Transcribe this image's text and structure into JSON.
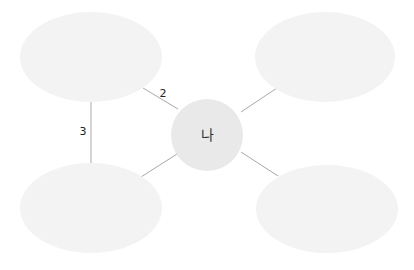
{
  "diagram": {
    "type": "mind-map",
    "center": {
      "label": "나",
      "cx": 207,
      "cy": 135,
      "r": 36,
      "color": "#e9e9e9"
    },
    "nodes": [
      {
        "id": "top-left",
        "label": "",
        "cx": 91,
        "cy": 57,
        "rx": 71,
        "ry": 45
      },
      {
        "id": "top-right",
        "label": "",
        "cx": 325,
        "cy": 57,
        "rx": 70,
        "ry": 45
      },
      {
        "id": "bottom-left",
        "label": "",
        "cx": 91,
        "cy": 208,
        "rx": 71,
        "ry": 45
      },
      {
        "id": "bottom-right",
        "label": "",
        "cx": 327,
        "cy": 209,
        "rx": 71,
        "ry": 44
      }
    ],
    "edges": [
      {
        "from": "top-left",
        "to": "center",
        "label": "2"
      },
      {
        "from": "top-left",
        "to": "bottom-left",
        "label": "3"
      },
      {
        "from": "top-right",
        "to": "center",
        "label": ""
      },
      {
        "from": "bottom-left",
        "to": "center",
        "label": ""
      },
      {
        "from": "bottom-right",
        "to": "center",
        "label": ""
      }
    ],
    "colors": {
      "node_fill": "#f3f3f3",
      "center_fill": "#e9e9e9",
      "edge": "#a8a8a8",
      "text": "#222222"
    }
  }
}
